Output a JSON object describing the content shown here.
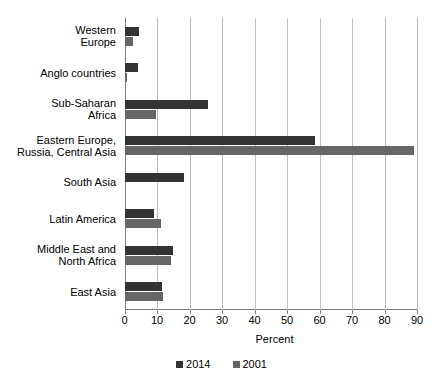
{
  "chart_data": {
    "type": "bar",
    "orientation": "horizontal",
    "title": "",
    "xlabel": "Percent",
    "ylabel": "",
    "xlim": [
      0,
      90
    ],
    "xticks": [
      0,
      10,
      20,
      30,
      40,
      50,
      60,
      70,
      80,
      90
    ],
    "xtick_labels": [
      "0",
      "10",
      "20",
      "30",
      "40",
      "50",
      "60",
      "70",
      "80",
      "90"
    ],
    "grid": true,
    "legend_position": "bottom-center",
    "categories": [
      "Western\nEurope",
      "Anglo countries",
      "Sub-Saharan\nAfrica",
      "Eastern Europe,\nRussia, Central Asia",
      "South Asia",
      "Latin America",
      "Middle East and\nNorth Africa",
      "East Asia"
    ],
    "series": [
      {
        "name": "2014",
        "color": "#333333",
        "values": [
          4.6,
          4.3,
          25.6,
          58.5,
          18.3,
          9.2,
          14.8,
          11.4
        ]
      },
      {
        "name": "2001",
        "color": "#666666",
        "values": [
          2.5,
          0.9,
          9.7,
          89.0,
          0,
          11.1,
          14.2,
          11.8
        ]
      }
    ]
  },
  "axis": {
    "grid_color": "#bfbfbf",
    "axis_color": "#808080"
  },
  "legend": {
    "items": [
      {
        "label": "2014",
        "color": "#333333"
      },
      {
        "label": "2001",
        "color": "#666666"
      }
    ]
  }
}
